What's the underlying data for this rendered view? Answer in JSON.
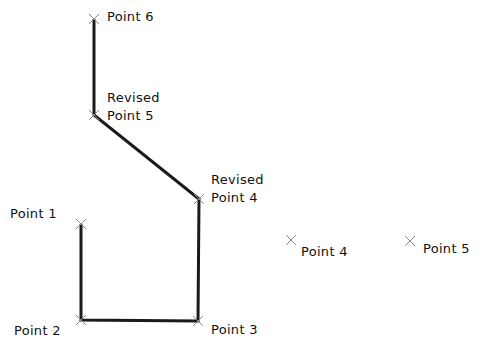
{
  "diagram": {
    "line_color": "#1a1a1a",
    "marker_color": "#888888",
    "polyline": [
      "p1",
      "p2",
      "p3",
      "rp4",
      "rp5",
      "p6"
    ],
    "points": [
      {
        "id": "p1",
        "x": 81,
        "y": 224,
        "label_lines": [
          "Point  1"
        ],
        "label_x": 10,
        "label_y": 205
      },
      {
        "id": "p2",
        "x": 81,
        "y": 320,
        "label_lines": [
          "Point  2"
        ],
        "label_x": 14,
        "label_y": 322
      },
      {
        "id": "p3",
        "x": 198,
        "y": 321,
        "label_lines": [
          "Point  3"
        ],
        "label_x": 211,
        "label_y": 321
      },
      {
        "id": "rp4",
        "x": 199,
        "y": 199,
        "label_lines": [
          "Revised",
          "Point  4"
        ],
        "label_x": 211,
        "label_y": 171
      },
      {
        "id": "rp5",
        "x": 94,
        "y": 115,
        "label_lines": [
          "Revised",
          "Point  5"
        ],
        "label_x": 107,
        "label_y": 89
      },
      {
        "id": "p6",
        "x": 94,
        "y": 19,
        "label_lines": [
          "Point  6"
        ],
        "label_x": 107,
        "label_y": 8
      },
      {
        "id": "p4",
        "x": 291,
        "y": 240,
        "label_lines": [
          "Point  4"
        ],
        "label_x": 301,
        "label_y": 243
      },
      {
        "id": "p5",
        "x": 410,
        "y": 241,
        "label_lines": [
          "Point  5"
        ],
        "label_x": 423,
        "label_y": 240
      }
    ]
  }
}
